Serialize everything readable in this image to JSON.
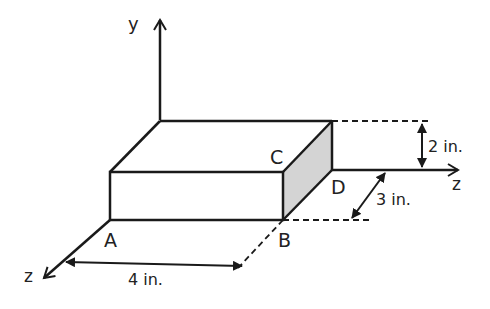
{
  "diagram": {
    "axes": {
      "y_label": "y",
      "z_right_label": "z",
      "z_left_label": "z"
    },
    "points": {
      "A": "A",
      "B": "B",
      "C": "C",
      "D": "D"
    },
    "dimensions": {
      "height": "2 in.",
      "depth": "3 in.",
      "width": "4 in."
    },
    "colors": {
      "stroke": "#1a1a1a",
      "shaded_face": "#d4d4d4",
      "text": "#222222"
    }
  }
}
